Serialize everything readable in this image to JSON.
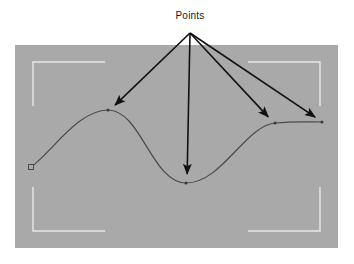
{
  "figure": {
    "title": "Points",
    "background_color": "#ffffff",
    "viewport": {
      "name": "viewport-panel",
      "fill": "#a9a9a9",
      "x": 15,
      "y": 45,
      "width": 323,
      "height": 203
    },
    "safe_frame": {
      "name": "safe-frame-brackets",
      "stroke": "#e8e8e8",
      "stroke_width": 1.4,
      "left": 33,
      "top": 62,
      "right": 320,
      "bottom": 231,
      "arm_length_x": 72,
      "arm_length_y": 44
    },
    "curve": {
      "name": "spline-curve",
      "stroke": "#4a4a4a",
      "stroke_width": 1.2,
      "path": "M 31,167 C 52,152 78,110 108,110 C 141,110 152,183 186,183 C 222,183 245,126 275,123 C 296,121 310,122 322,122"
    },
    "start_handle": {
      "name": "start-point-handle",
      "shape": "square",
      "x": 31,
      "y": 167,
      "size": 5,
      "stroke": "#4a4a4a",
      "fill": "#a9a9a9"
    },
    "label": {
      "text": "Points",
      "x": 190,
      "y": 19,
      "color": "#1a1a1a",
      "font_size": 10
    },
    "arrow_origin": {
      "x": 190,
      "y": 33
    },
    "arrow_color": "#111111",
    "arrow_stroke_width": 1.6,
    "arrows": [
      {
        "name": "arrow-to-first-peak",
        "target_label": "first-peak-point",
        "x1": 190,
        "y1": 33,
        "x2": 110,
        "y2": 110
      },
      {
        "name": "arrow-to-trough",
        "target_label": "trough-point",
        "x1": 190,
        "y1": 33,
        "x2": 187,
        "y2": 181
      },
      {
        "name": "arrow-to-second-peak",
        "target_label": "second-peak-point",
        "x1": 190,
        "y1": 33,
        "x2": 273,
        "y2": 122
      },
      {
        "name": "arrow-to-end-point",
        "target_label": "end-point",
        "x1": 190,
        "y1": 33,
        "x2": 321,
        "y2": 121
      }
    ],
    "points": [
      {
        "name": "start-point",
        "x": 31,
        "y": 167,
        "annotated": false
      },
      {
        "name": "first-peak-point",
        "x": 108,
        "y": 110,
        "annotated": true
      },
      {
        "name": "trough-point",
        "x": 186,
        "y": 183,
        "annotated": true
      },
      {
        "name": "second-peak-point",
        "x": 275,
        "y": 123,
        "annotated": true
      },
      {
        "name": "end-point",
        "x": 322,
        "y": 122,
        "annotated": true
      }
    ]
  }
}
